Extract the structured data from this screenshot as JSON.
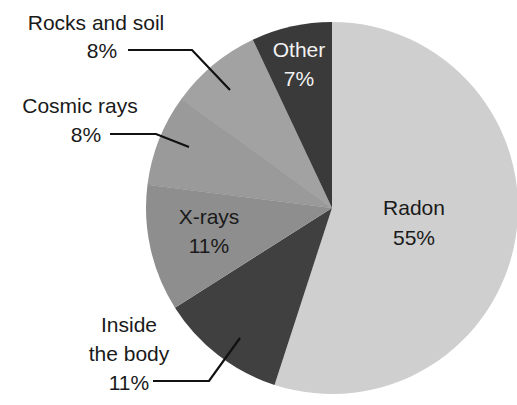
{
  "chart_data": {
    "type": "pie",
    "title": "",
    "start_angle_deg": 0,
    "direction": "clockwise",
    "slices": [
      {
        "label": "Radon",
        "value": 55,
        "display": "55%",
        "color": "#cfcfcf",
        "text_color": "#1a1a1a"
      },
      {
        "label": "Inside the body",
        "value": 11,
        "display": "11%",
        "color": "#404040",
        "text_color": "#1a1a1a"
      },
      {
        "label": "X-rays",
        "value": 11,
        "display": "11%",
        "color": "#8e8e8e",
        "text_color": "#1a1a1a"
      },
      {
        "label": "Cosmic rays",
        "value": 8,
        "display": "8%",
        "color": "#9a9a9a",
        "text_color": "#1a1a1a"
      },
      {
        "label": "Rocks and soil",
        "value": 8,
        "display": "8%",
        "color": "#a2a2a2",
        "text_color": "#1a1a1a"
      },
      {
        "label": "Other",
        "value": 7,
        "display": "7%",
        "color": "#3a3a3a",
        "text_color": "#f2f2f2"
      }
    ],
    "legend": "none (labels placed on/beside slices with leader lines)"
  },
  "labels": {
    "radon": {
      "name": "Radon",
      "pct": "55%"
    },
    "inside": {
      "name1": "Inside",
      "name2": "the body",
      "pct": "11%"
    },
    "xrays": {
      "name": "X-rays",
      "pct": "11%"
    },
    "cosmic": {
      "name": "Cosmic rays",
      "pct": "8%"
    },
    "rocks": {
      "name": "Rocks and soil",
      "pct": "8%"
    },
    "other": {
      "name": "Other",
      "pct": "7%"
    }
  }
}
